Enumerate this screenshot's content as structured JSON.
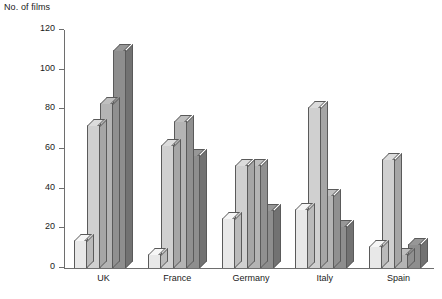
{
  "chart_data": {
    "type": "bar",
    "title": "",
    "ylabel": "No. of films",
    "xlabel": "",
    "ylim": [
      0,
      120
    ],
    "yticks": [
      0,
      20,
      40,
      60,
      80,
      100,
      120
    ],
    "grid": false,
    "legend": "none",
    "style": "3d-grouped-bars",
    "categories": [
      "UK",
      "France",
      "Germany",
      "Italy",
      "Spain"
    ],
    "series": [
      {
        "name": "Series 1",
        "color": "#e8e8e8",
        "values": [
          14,
          7,
          25,
          30,
          11
        ]
      },
      {
        "name": "Series 2",
        "color": "#d0d0d0",
        "values": [
          72,
          62,
          52,
          81,
          55
        ]
      },
      {
        "name": "Series 3",
        "color": "#b4b4b4",
        "values": [
          83,
          74,
          52,
          37,
          7
        ]
      },
      {
        "name": "Series 4",
        "color": "#8e8e8e",
        "values": [
          110,
          57,
          29,
          21,
          12
        ]
      }
    ],
    "axis_color": "#6e6e6e",
    "bar_outline_color": "#5a5a5a"
  },
  "labels": {
    "ylabel": "No. of films",
    "ytick_0": "0",
    "ytick_1": "20",
    "ytick_2": "40",
    "ytick_3": "60",
    "ytick_4": "80",
    "ytick_5": "100",
    "ytick_6": "120",
    "cat_0": "UK",
    "cat_1": "France",
    "cat_2": "Germany",
    "cat_3": "Italy",
    "cat_4": "Spain"
  }
}
